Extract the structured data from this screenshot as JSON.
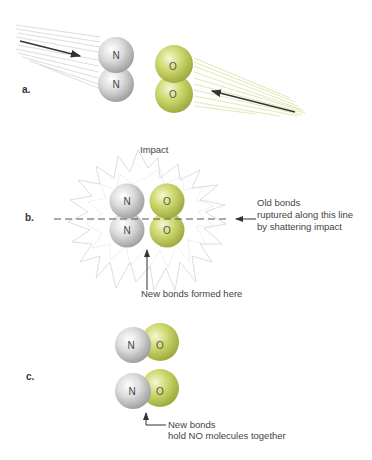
{
  "figure": {
    "panels": [
      {
        "label": "a.",
        "description": "N2 and O2 molecules approaching each other",
        "molecules": [
          {
            "formula": "N2",
            "atoms": [
              "N",
              "N"
            ]
          },
          {
            "formula": "O2",
            "atoms": [
              "O",
              "O"
            ]
          }
        ]
      },
      {
        "label": "b.",
        "impact_label": "Impact",
        "annotations": {
          "old_bonds": [
            "Old bonds",
            "ruptured along this line",
            "by shattering impact"
          ],
          "new_bonds": "New bonds formed here"
        },
        "molecules": [
          {
            "formula": "N2",
            "atoms": [
              "N",
              "N"
            ]
          },
          {
            "formula": "O2",
            "atoms": [
              "O",
              "O"
            ]
          }
        ]
      },
      {
        "label": "c.",
        "annotations": {
          "new_bonds": [
            "New bonds",
            "hold NO molecules together"
          ]
        },
        "molecules": [
          {
            "formula": "NO",
            "atoms": [
              "N",
              "O"
            ]
          },
          {
            "formula": "NO",
            "atoms": [
              "N",
              "O"
            ]
          }
        ]
      }
    ],
    "colors": {
      "nitrogen": "#c8c8c8",
      "oxygen": "#c8d46a",
      "arrow": "#333333",
      "motion_lines_n": "#bdbdbd",
      "motion_lines_o": "#d6df9a"
    }
  }
}
